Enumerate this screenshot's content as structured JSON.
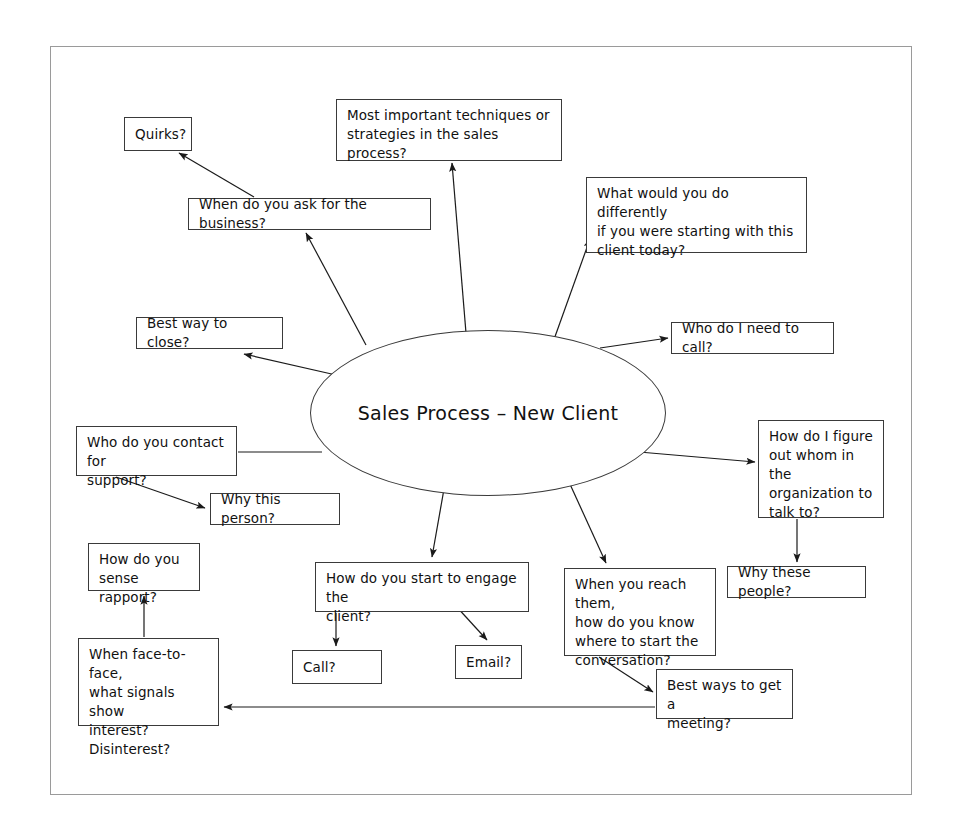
{
  "diagram": {
    "title": "Sales Process – New Client",
    "type": "mind-map",
    "frame": {
      "border_color": "#9a9a9a"
    },
    "colors": {
      "node_border": "#3a3a3a",
      "node_fill": "#ffffff",
      "edge": "#1a1a1a",
      "text": "#111111",
      "frame": "#9a9a9a"
    },
    "center": {
      "label": "Sales Process – New Client",
      "shape": "ellipse",
      "x": 310,
      "y": 330,
      "w": 356,
      "h": 166
    },
    "nodes": [
      {
        "id": "quirks",
        "label": "Quirks?",
        "x": 124,
        "y": 117,
        "w": 68,
        "h": 34,
        "align": "center"
      },
      {
        "id": "most-important-techniques",
        "label": "Most important techniques or\nstrategies in the sales process?",
        "x": 336,
        "y": 99,
        "w": 226,
        "h": 62,
        "align": "top"
      },
      {
        "id": "what-would-you-do-differently",
        "label": "What would you do differently\nif you were starting with this\nclient today?",
        "x": 586,
        "y": 177,
        "w": 221,
        "h": 76,
        "align": "top"
      },
      {
        "id": "when-ask-for-business",
        "label": "When do you ask for the business?",
        "x": 188,
        "y": 198,
        "w": 243,
        "h": 32,
        "align": "center"
      },
      {
        "id": "best-way-to-close",
        "label": "Best way to close?",
        "x": 136,
        "y": 317,
        "w": 147,
        "h": 32,
        "align": "center"
      },
      {
        "id": "who-do-i-need-to-call",
        "label": "Who do I need to call?",
        "x": 671,
        "y": 322,
        "w": 163,
        "h": 32,
        "align": "center"
      },
      {
        "id": "who-do-you-contact-for-support",
        "label": "Who do you contact for\nsupport?",
        "x": 76,
        "y": 426,
        "w": 161,
        "h": 50,
        "align": "top"
      },
      {
        "id": "how-do-i-figure-out-whom",
        "label": "How do I figure\nout whom in the\norganization to\ntalk to?",
        "x": 758,
        "y": 420,
        "w": 126,
        "h": 98,
        "align": "top"
      },
      {
        "id": "why-this-person",
        "label": "Why this person?",
        "x": 210,
        "y": 493,
        "w": 130,
        "h": 32,
        "align": "center"
      },
      {
        "id": "how-do-you-sense-rapport",
        "label": "How do you\nsense rapport?",
        "x": 88,
        "y": 543,
        "w": 112,
        "h": 48,
        "align": "top"
      },
      {
        "id": "how-do-you-start-to-engage",
        "label": "How do you start to engage the\nclient?",
        "x": 315,
        "y": 562,
        "w": 214,
        "h": 50,
        "align": "top"
      },
      {
        "id": "when-you-reach-them",
        "label": "When you reach them,\nhow do you know\nwhere to start the\nconversation?",
        "x": 564,
        "y": 568,
        "w": 152,
        "h": 88,
        "align": "top"
      },
      {
        "id": "why-these-people",
        "label": "Why these people?",
        "x": 727,
        "y": 566,
        "w": 139,
        "h": 32,
        "align": "center"
      },
      {
        "id": "when-face-to-face",
        "label": "When face-to-face,\nwhat signals show\ninterest?\nDisinterest?",
        "x": 78,
        "y": 638,
        "w": 141,
        "h": 88,
        "align": "top"
      },
      {
        "id": "call",
        "label": "Call?",
        "x": 292,
        "y": 650,
        "w": 90,
        "h": 34,
        "align": "center"
      },
      {
        "id": "email",
        "label": "Email?",
        "x": 455,
        "y": 645,
        "w": 67,
        "h": 34,
        "align": "center"
      },
      {
        "id": "best-ways-to-get-a-meeting",
        "label": "Best ways to get a\nmeeting?",
        "x": 656,
        "y": 669,
        "w": 137,
        "h": 50,
        "align": "top"
      }
    ],
    "edges": [
      {
        "id": "center-to-most-important",
        "from": "center",
        "to": "most-important-techniques",
        "arrow": true,
        "path": "M 466 333 L 452 163"
      },
      {
        "id": "center-to-what-would-you-do",
        "from": "center",
        "to": "what-would-you-do-differently",
        "arrow": true,
        "path": "M 552 345 L 590 239"
      },
      {
        "id": "center-to-when-ask-for-business",
        "from": "center",
        "to": "when-ask-for-business",
        "arrow": true,
        "path": "M 366 345 L 306 233"
      },
      {
        "id": "when-ask-to-quirks",
        "from": "when-ask-for-business",
        "to": "quirks",
        "arrow": true,
        "path": "M 254 197 L 179 153"
      },
      {
        "id": "center-to-best-way-to-close",
        "from": "center",
        "to": "best-way-to-close",
        "arrow": true,
        "path": "M 336 375 L 244 354"
      },
      {
        "id": "center-to-who-do-i-need-to-call",
        "from": "center",
        "to": "who-do-i-need-to-call",
        "arrow": true,
        "path": "M 600 348 L 668 338"
      },
      {
        "id": "center-to-who-do-you-contact",
        "from": "center",
        "to": "who-do-you-contact-for-support",
        "arrow": false,
        "path": "M 322 452 L 238 452"
      },
      {
        "id": "who-contact-to-why-this-person",
        "from": "who-do-you-contact-for-support",
        "to": "why-this-person",
        "arrow": true,
        "path": "M 116 477 L 205 508"
      },
      {
        "id": "center-to-how-do-i-figure-out",
        "from": "center",
        "to": "how-do-i-figure-out-whom",
        "arrow": true,
        "path": "M 639 452 L 755 462"
      },
      {
        "id": "figure-out-to-why-these-people",
        "from": "how-do-i-figure-out-whom",
        "to": "why-these-people",
        "arrow": true,
        "path": "M 797 519 L 797 562"
      },
      {
        "id": "center-to-how-do-you-start",
        "from": "center",
        "to": "how-do-you-start-to-engage",
        "arrow": true,
        "path": "M 444 489 L 432 557"
      },
      {
        "id": "center-to-when-you-reach-them",
        "from": "center",
        "to": "when-you-reach-them",
        "arrow": true,
        "path": "M 569 482 L 606 563"
      },
      {
        "id": "engage-to-call",
        "from": "how-do-you-start-to-engage",
        "to": "call",
        "arrow": true,
        "path": "M 336 613 L 336 646"
      },
      {
        "id": "engage-to-email",
        "from": "how-do-you-start-to-engage",
        "to": "email",
        "arrow": true,
        "path": "M 455 605 L 487 640"
      },
      {
        "id": "reach-them-to-best-ways",
        "from": "when-you-reach-them",
        "to": "best-ways-to-get-a-meeting",
        "arrow": true,
        "path": "M 599 657 L 653 692"
      },
      {
        "id": "best-ways-to-face-to-face",
        "from": "best-ways-to-get-a-meeting",
        "to": "when-face-to-face",
        "arrow": true,
        "path": "M 655 707 L 224 707"
      },
      {
        "id": "face-to-face-to-rapport",
        "from": "when-face-to-face",
        "to": "how-do-you-sense-rapport",
        "arrow": true,
        "path": "M 144 637 L 144 596"
      }
    ]
  }
}
